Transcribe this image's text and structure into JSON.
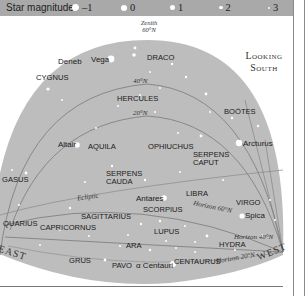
{
  "legend": {
    "title": "Star magnitudes",
    "items": [
      {
        "label": "–1",
        "x": 72,
        "size": 7
      },
      {
        "label": "0",
        "x": 121,
        "size": 6
      },
      {
        "label": "1",
        "x": 170,
        "size": 5
      },
      {
        "label": "2",
        "x": 219,
        "size": 3.5
      },
      {
        "label": "3",
        "x": 268,
        "size": 2
      }
    ]
  },
  "orientation": {
    "line1": "Looking",
    "line2": "South"
  },
  "directions": {
    "east": "EAST",
    "west": "WEST"
  },
  "zenith": {
    "line1": "Zenith",
    "line2": "60°N"
  },
  "latitude_lines": {
    "lat40": "40°N",
    "lat20": "20°N"
  },
  "ecliptic": "Ecliptic",
  "horizons": {
    "h60": "Horizon 60°N",
    "h40": "Horizon 40°N",
    "h20": "Horizon 20°N"
  },
  "constellations": [
    {
      "name": "DRACO",
      "x": 147,
      "y": 54
    },
    {
      "name": "CYGNUS",
      "x": 36,
      "y": 74
    },
    {
      "name": "HERCULES",
      "x": 117,
      "y": 95
    },
    {
      "name": "BOÖTES",
      "x": 224,
      "y": 108
    },
    {
      "name": "AQUILA",
      "x": 88,
      "y": 143
    },
    {
      "name": "OPHIUCHUS",
      "x": 148,
      "y": 143
    },
    {
      "name": "SERPENS",
      "x": 193,
      "y": 151
    },
    {
      "name": "CAPUT",
      "x": 193,
      "y": 159
    },
    {
      "name": "SERPENS",
      "x": 106,
      "y": 170
    },
    {
      "name": "CAUDA",
      "x": 106,
      "y": 178
    },
    {
      "name": "LIBRA",
      "x": 186,
      "y": 190
    },
    {
      "name": "VIRGO",
      "x": 236,
      "y": 199
    },
    {
      "name": "SCORPIUS",
      "x": 143,
      "y": 206
    },
    {
      "name": "SAGITTARIUS",
      "x": 81,
      "y": 213
    },
    {
      "name": "QUARIUS",
      "x": 3,
      "y": 220
    },
    {
      "name": "CAPRICORNUS",
      "x": 40,
      "y": 224
    },
    {
      "name": "LUPUS",
      "x": 154,
      "y": 228
    },
    {
      "name": "HYDRA",
      "x": 219,
      "y": 241
    },
    {
      "name": "ARA",
      "x": 126,
      "y": 242
    },
    {
      "name": "GRUS",
      "x": 69,
      "y": 257
    },
    {
      "name": "PAVO",
      "x": 112,
      "y": 262
    },
    {
      "name": "CENTAURUS",
      "x": 174,
      "y": 258
    },
    {
      "name": "GASUS",
      "x": 2,
      "y": 176
    }
  ],
  "stars_named": [
    {
      "name": "Deneb",
      "x": 57,
      "y": 61
    },
    {
      "name": "Vega",
      "x": 91,
      "y": 61
    },
    {
      "name": "Altair",
      "x": 58,
      "y": 143
    },
    {
      "name": "Arcturus",
      "x": 243,
      "y": 141
    },
    {
      "name": "Antares",
      "x": 141,
      "y": 195
    },
    {
      "name": "Spica",
      "x": 244,
      "y": 214
    },
    {
      "name": "α Centauri",
      "x": 136,
      "y": 262
    }
  ],
  "colors": {
    "sky": "#bdbdbd",
    "legend_bar": "#a9a9a9",
    "lines": "#777777",
    "star": "#ffffff",
    "text": "#1a1a1a"
  }
}
